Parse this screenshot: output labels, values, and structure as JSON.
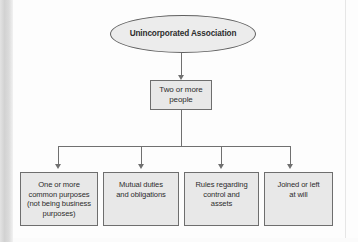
{
  "diagram": {
    "type": "hierarchy-flowchart",
    "root": {
      "label": "Unincorporated Association",
      "shape": "ellipse"
    },
    "middle": {
      "label": "Two or more\npeople",
      "shape": "rectangle"
    },
    "leaves": [
      {
        "label": "One or more\ncommon purposes\n(not being business\npurposes)",
        "shape": "rectangle"
      },
      {
        "label": "Mutual duties\nand obligations",
        "shape": "rectangle"
      },
      {
        "label": "Rules regarding\ncontrol and\nassets",
        "shape": "rectangle"
      },
      {
        "label": "Joined or left\nat will",
        "shape": "rectangle"
      }
    ],
    "colors": {
      "node_fill": "#e8e8e8",
      "node_border": "#6e6e6e",
      "connector": "#707070",
      "text": "#2d2d2d",
      "background": "#fdfdfd"
    }
  }
}
